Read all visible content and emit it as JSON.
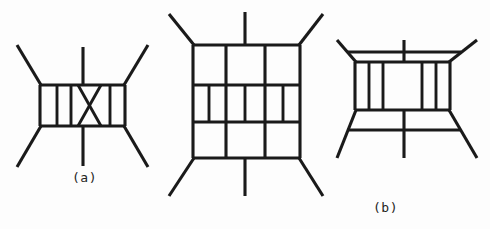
{
  "figure": {
    "background_color": "#fdfdfd",
    "ink_color": "#1a1a1a",
    "width": 490,
    "height": 229,
    "panel_count": 3
  },
  "panels": [
    {
      "id": "a",
      "label": "(a)",
      "description": "Box diagram with two vertical rungs and a crossed X rung, four external legs and one upper and one lower vertical leg",
      "box": {
        "left": 40,
        "top": 85,
        "right": 125,
        "bottom": 126
      },
      "vertical_rungs_x": [
        58,
        72,
        110
      ],
      "crossed_rung": true,
      "external_legs": 4,
      "vertical_legs": 2
    },
    {
      "id": "b",
      "label": "(b)",
      "description": "Tall box divided by two full vertical lines into three columns, each column containing an I-shaped rung between two horizontal bands",
      "box": {
        "left": 38,
        "top": 45,
        "right": 145,
        "bottom": 158
      },
      "full_vertical_dividers_x": [
        70,
        110
      ],
      "horizontal_bands_y": [
        85,
        122
      ],
      "i_rungs": 3,
      "external_legs": 4,
      "vertical_legs": 2
    },
    {
      "id": "c",
      "label": "(c)",
      "description": "Box with four vertical rungs plus an upper and a lower horizontal line crossing the vertical legs",
      "box": {
        "left": 30,
        "top": 62,
        "right": 125,
        "bottom": 110
      },
      "vertical_rungs_x": [
        44,
        58,
        92,
        106
      ],
      "extra_horizontal_lines_y": [
        42,
        132
      ],
      "external_legs": 4,
      "vertical_legs": 2
    }
  ],
  "labels": {
    "a": "(a)",
    "b": "(b)",
    "c": "(c)"
  }
}
